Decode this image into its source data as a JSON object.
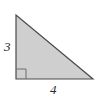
{
  "figure": {
    "kind": "right-triangle",
    "background_color": "#ffffff",
    "fill_color": "#cfcfcf",
    "stroke_color": "#4a4a4a",
    "right_angle_marker_color": "#6e6e6e",
    "vertices": {
      "top": [
        16,
        15
      ],
      "bottom_left": [
        16,
        79
      ],
      "bottom_right": [
        93,
        79
      ]
    },
    "right_angle_marker": {
      "at": "bottom_left",
      "size": 10
    },
    "labels": {
      "vertical_leg": "3",
      "base": "4"
    }
  },
  "chart_data": {
    "type": "diagram",
    "title": "",
    "shape": "right triangle",
    "legs": [
      {
        "name": "vertical leg",
        "label": "3",
        "value": 3
      },
      {
        "name": "horizontal base",
        "label": "4",
        "value": 4
      }
    ],
    "annotations": [
      "3",
      "4"
    ],
    "right_angle": true
  }
}
